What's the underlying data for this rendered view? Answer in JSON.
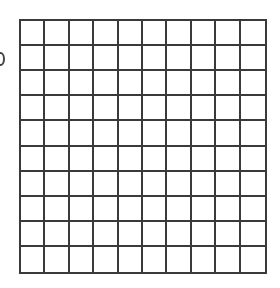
{
  "diagram": {
    "type": "square-grid",
    "rows": 10,
    "columns": 10,
    "line_color": "#3a3a3a",
    "background": "#ffffff"
  }
}
